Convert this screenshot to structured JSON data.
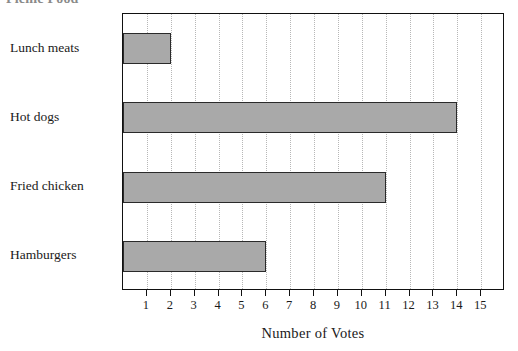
{
  "chart_data": {
    "type": "bar",
    "orientation": "horizontal",
    "title": "Picnic Food",
    "categories": [
      "Lunch meats",
      "Hot dogs",
      "Fried chicken",
      "Hamburgers"
    ],
    "values": [
      2,
      14,
      11,
      6
    ],
    "xlabel": "Number of Votes",
    "ylabel": "",
    "xlim": [
      0,
      16
    ],
    "xticks": [
      1,
      2,
      3,
      4,
      5,
      6,
      7,
      8,
      9,
      10,
      11,
      12,
      13,
      14,
      15
    ],
    "xtick_labels": [
      "1",
      "2",
      "3",
      "4",
      "5",
      "6",
      "7",
      "8",
      "9",
      "10",
      "11",
      "12",
      "13",
      "14",
      "15"
    ],
    "grid": "vertical-dotted",
    "legend": null,
    "bar_color": "#a9a9a9",
    "bar_edge_color": "#2a2a2a",
    "frame_color": "#111111"
  }
}
